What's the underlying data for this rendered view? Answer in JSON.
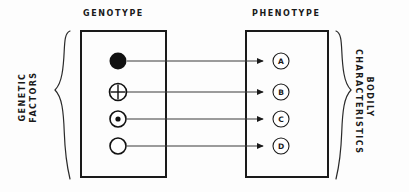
{
  "diagram": {
    "titles": {
      "genotype": "GENOTYPE",
      "phenotype": "PHENOTYPE"
    },
    "left_bracket_label": {
      "line1": "GENETIC",
      "line2": "FACTORS"
    },
    "right_bracket_label": {
      "line1": "BODILY",
      "line2": "CHARACTERISTICS"
    },
    "genotype_symbols": [
      {
        "name": "filled-circle",
        "cy": 61
      },
      {
        "name": "circle-with-cross",
        "cy": 92
      },
      {
        "name": "circle-with-dot",
        "cy": 119
      },
      {
        "name": "empty-circle",
        "cy": 146
      }
    ],
    "phenotype_traits": [
      {
        "label": "A",
        "cy": 61
      },
      {
        "label": "B",
        "cy": 92
      },
      {
        "label": "C",
        "cy": 119
      },
      {
        "label": "D",
        "cy": 146
      }
    ],
    "arrow_count": 4,
    "colors": {
      "ink": "#1a1a1a",
      "line": "#333333",
      "background": "#fdfdfd"
    }
  }
}
